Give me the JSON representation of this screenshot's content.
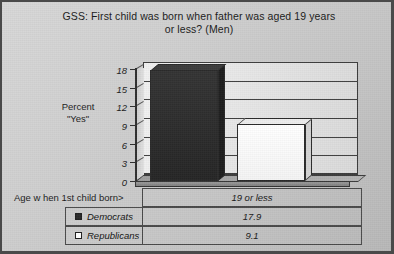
{
  "chart_data": {
    "type": "bar",
    "title": "GSS: First child was born when father was aged 19 years or less? (Men)",
    "title_line1": "GSS: First child was born when father was aged 19 years",
    "title_line2": "or less? (Men)",
    "xlabel": "Age w hen 1st child born>",
    "ylabel_line1": "Percent",
    "ylabel_line2": "\"Yes\"",
    "categories": [
      "19 or less"
    ],
    "series": [
      {
        "name": "Democrats",
        "values": [
          17.9
        ],
        "color": "#2b2b2b"
      },
      {
        "name": "Republicans",
        "values": [
          9.1
        ],
        "color": "#ffffff"
      }
    ],
    "ylim": [
      0,
      18
    ],
    "yticks": [
      18,
      15,
      12,
      9,
      6,
      3,
      0
    ],
    "ytick_labels": [
      "18",
      "15",
      "12",
      "9",
      "6",
      "3",
      "0"
    ],
    "grid": true,
    "legend_position": "table-below",
    "style": "3d-bar"
  },
  "table": {
    "row_header_label": "Age w hen 1st child born>",
    "column_headers": [
      "19 or less"
    ],
    "rows": [
      {
        "series": "Democrats",
        "swatch": "filled-dark-square",
        "values": [
          "17.9"
        ]
      },
      {
        "series": "Republicans",
        "swatch": "empty-white-square",
        "values": [
          "9.1"
        ]
      }
    ]
  }
}
